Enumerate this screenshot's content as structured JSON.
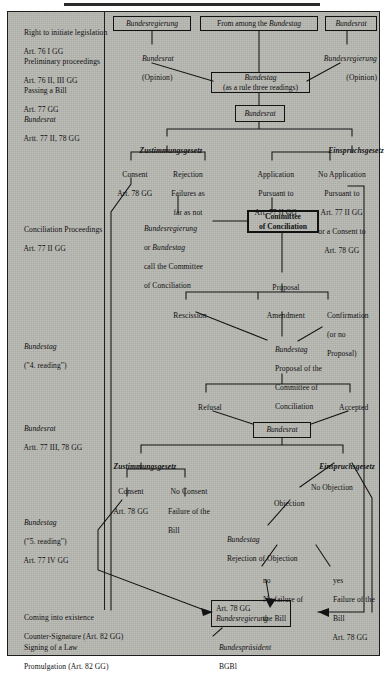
{
  "diagram": {
    "title_rule": true,
    "left_column": [
      {
        "id": "right-to-initiate",
        "lines": [
          "Right to initiate legislation",
          "Art. 76 I GG"
        ]
      },
      {
        "id": "preliminary-proceedings",
        "lines": [
          "Preliminary proceedings",
          "Art. 76 II, III GG"
        ]
      },
      {
        "id": "passing-a-bill",
        "lines": [
          "Passing a Bill",
          "Art. 77 GG"
        ]
      },
      {
        "id": "bundesrat-77-2-78",
        "lines": [
          "Bundesrat",
          "Artt. 77 II, 78 GG"
        ],
        "italic_first": true
      },
      {
        "id": "conciliation-proceedings",
        "lines": [
          "Conciliation Proceedings",
          "Art. 77 II GG"
        ]
      },
      {
        "id": "bundestag-4-reading",
        "lines": [
          "Bundestag",
          "(\"4. reading\")"
        ],
        "italic_first": true
      },
      {
        "id": "bundesrat-77-3-78",
        "lines": [
          "Bundesrat",
          "Artt. 77 III, 78 GG"
        ],
        "italic_first": true
      },
      {
        "id": "bundestag-5-reading",
        "lines": [
          "Bundestag",
          "(\"5. reading\")",
          "Art. 77 IV GG"
        ],
        "italic_first": true
      },
      {
        "id": "coming-into-existence",
        "lines": [
          "Coming into existence",
          "Counter-Signature (Art. 82 GG)"
        ]
      },
      {
        "id": "signing-of-a-law",
        "lines": [
          "Signing of a Law",
          "Promulgation (Art. 82 GG)"
        ]
      }
    ],
    "boxes": {
      "bundesregierung_top": "Bundesregierung",
      "from_among_bundestag_pre": "From among the ",
      "from_among_bundestag_em": "Bundestag",
      "bundesrat_top": "Bundesrat",
      "bundestag_readings_l1": "Bundestag",
      "bundestag_readings_l2": "(as a rule three readings)",
      "bundesrat_second": "Bundesrat",
      "committee_l1": "Committee",
      "committee_l2": "of Conciliation",
      "bundesrat_third": "Bundesrat",
      "final_l1": "Art. 78 GG",
      "final_l2": "Bundesregierung"
    },
    "labels": {
      "bundesrat_opinion_l1": "Bundesrat",
      "bundesrat_opinion_l2": "(Opinion)",
      "bundesregierung_opinion_l1": "Bundesregierung",
      "bundesregierung_opinion_l2": "(Opinion)",
      "zustimmungsgesetz_1": "Zustimmungsgesetz",
      "einspruchsgesetz_1": "Einspruchsgesetz",
      "consent_l1": "Consent",
      "consent_l2": "Art. 78 GG",
      "rejection_l1": "Rejection",
      "rejection_l2": "Failures as",
      "rejection_l3": "far as not",
      "application_l1": "Application",
      "application_l2": "Pursuant to",
      "application_l3": "Art. 77 II GG",
      "no_application_l1": "No Application",
      "no_application_l2": "Pursuant to",
      "no_application_l3": "Art. 77 II GG",
      "no_application_l4": "or a Consent to",
      "no_application_l5": "Art. 78 GG",
      "call_committee_l1": "Bundesregierung",
      "call_committee_l2_pre": "or ",
      "call_committee_l2_em": "Bundestag",
      "call_committee_l3": "call the Committee",
      "call_committee_l4": "of Conciliation",
      "proposal": "Proposal",
      "rescission": "Rescission",
      "amendment": "Amendment",
      "confirmation_l1": "Confirmation",
      "confirmation_l2": "(or no",
      "confirmation_l3": "Proposal)",
      "bundestag_proposal_l1": "Bundestag",
      "bundestag_proposal_l2": "Proposal of the",
      "bundestag_proposal_l3": "Committee of",
      "bundestag_proposal_l4": "Conciliation",
      "refusal": "Refusal",
      "accepted": "Accepted",
      "zustimmungsgesetz_2": "Zustimmungsgesetz",
      "einspruchsgesetz_2": "Einspruchsgesetz",
      "consent2": "Consent",
      "consent2_art": "Art. 78 GG",
      "no_consent": "No Consent",
      "failure_of_bill_l1": "Failure of the",
      "failure_of_bill_l2": "Bill",
      "no_objection": "No Objection",
      "objection": "Objection",
      "bundestag_rejection_l1": "Bundestag",
      "bundestag_rejection_l2": "Rejection of Objection",
      "no_label": "no",
      "no_failure_l1": "No failure of",
      "no_failure_l2": "the Bill",
      "yes_label": "yes",
      "failure_yes_l1": "Failure of the",
      "failure_yes_l2": "Bill",
      "failure_yes_l3": "Art. 78 GG",
      "bundespraesident": "Bundespräsident",
      "bgbl": "BGBl"
    },
    "colors": {
      "panel_background": "#b9b9b4",
      "ink": "#131313",
      "page_background": "#ffffff"
    }
  }
}
